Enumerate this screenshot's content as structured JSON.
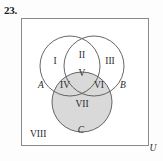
{
  "figure": {
    "problem_number": "23.",
    "universe_box": {
      "label": "U",
      "border_color": "#8a8a8a"
    },
    "shading_color": "#d9d9d9",
    "stroke_color": "#555555",
    "text_color": "#2a2a2a",
    "sets": [
      {
        "id": "A",
        "label": "A",
        "shaded": false
      },
      {
        "id": "B",
        "label": "B",
        "shaded": false
      },
      {
        "id": "C",
        "label": "C",
        "shaded": true
      }
    ],
    "regions": [
      {
        "id": "I",
        "label": "I",
        "description": "A only",
        "shaded": false
      },
      {
        "id": "II",
        "label": "II",
        "description": "A and B only",
        "shaded": false
      },
      {
        "id": "III",
        "label": "III",
        "description": "B only",
        "shaded": false
      },
      {
        "id": "IV",
        "label": "IV",
        "description": "A and C only",
        "shaded": true
      },
      {
        "id": "V",
        "label": "V",
        "description": "A and B and C",
        "shaded": true
      },
      {
        "id": "VI",
        "label": "VI",
        "description": "B and C only",
        "shaded": true
      },
      {
        "id": "VII",
        "label": "VII",
        "description": "C only",
        "shaded": true
      },
      {
        "id": "VIII",
        "label": "VIII",
        "description": "outside all sets",
        "shaded": false
      }
    ]
  }
}
